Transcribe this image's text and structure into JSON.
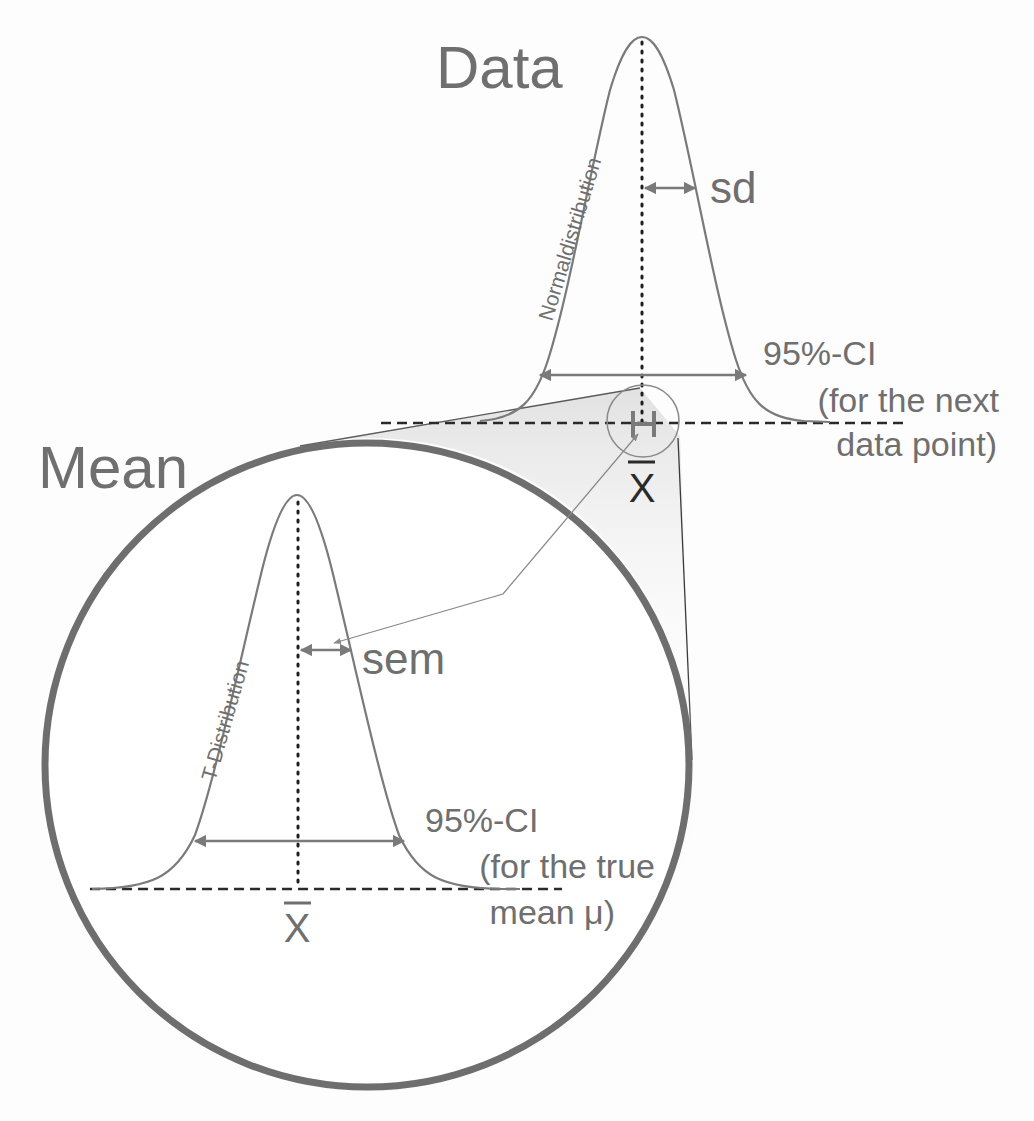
{
  "colors": {
    "background": "#fdfdfd",
    "curve": "#7a7a7a",
    "text": "#6f6f6f",
    "dotted": "#1e1e1e",
    "dashed": "#2a2a2a",
    "circle": "#6e6e6e"
  },
  "top_panel": {
    "title": "Data",
    "curve_label": "Normaldistribution",
    "spread_label": "sd",
    "ci_line1": "95%-CI",
    "ci_line2": "(for the next",
    "ci_line3": "data point)",
    "center_symbol": "x̄",
    "error_bar_glyph": "H"
  },
  "bottom_panel": {
    "title": "Mean",
    "curve_label": "T-Distribution",
    "spread_label": "sem",
    "ci_line1": "95%-CI",
    "ci_line2": "(for the true",
    "ci_line3": "mean μ)",
    "center_symbol": "x̄"
  }
}
